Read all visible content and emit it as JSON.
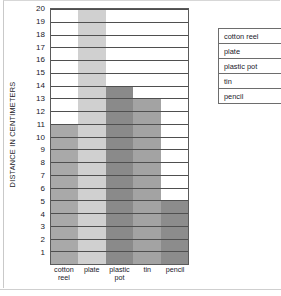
{
  "chart_data": {
    "type": "bar",
    "title": "",
    "subtitle": "",
    "xlabel": "",
    "ylabel": "DISTANCE IN CENTIMETERS",
    "categories": [
      "cotton reel",
      "plate",
      "plastic pot",
      "tin",
      "pencil"
    ],
    "category_labels_wrapped": [
      "cotton\nreel",
      "plate",
      "plastic\npot",
      "tin",
      "pencil"
    ],
    "values": [
      11,
      20,
      14,
      13,
      5
    ],
    "series": [
      {
        "name": "distance",
        "values": [
          11,
          20,
          14,
          13,
          5
        ]
      }
    ],
    "bar_colors": [
      "#a9a9a9",
      "#d0d0d0",
      "#8a8a8a",
      "#a3a3a3",
      "#8c8c8c"
    ],
    "ylim": [
      0,
      20
    ],
    "ytick_labels": [
      "20",
      "19",
      "18",
      "17",
      "16",
      "15",
      "14",
      "13",
      "12",
      "11",
      "10",
      "9",
      "8",
      "7",
      "6",
      "5",
      "4",
      "3",
      "2",
      "1"
    ],
    "ytick_values": [
      20,
      19,
      18,
      17,
      16,
      15,
      14,
      13,
      12,
      11,
      10,
      9,
      8,
      7,
      6,
      5,
      4,
      3,
      2,
      1
    ],
    "grid": true,
    "grid_axis": "y",
    "legend_position": "right",
    "bar_gap": 0
  },
  "legend": {
    "rows": [
      {
        "label": "cotton reel"
      },
      {
        "label": "plate"
      },
      {
        "label": "plastic pot"
      },
      {
        "label": "tin"
      },
      {
        "label": "pencil"
      }
    ]
  }
}
